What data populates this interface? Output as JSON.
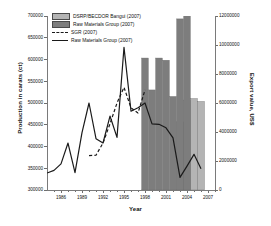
{
  "chart_data": {
    "type": "bar",
    "title": "",
    "xlabel": "Year",
    "ylabel": "Production in carats (ct)",
    "ylabel_right": "Export value, US$",
    "grid": false,
    "legend_position": "top-left",
    "xlim": [
      1984,
      2008
    ],
    "ylim": [
      300000,
      700000
    ],
    "ylim_right": [
      0,
      12000000
    ],
    "x_ticks": [
      1986,
      1989,
      1992,
      1995,
      1998,
      2001,
      2004,
      2007
    ],
    "x_tick_labels": [
      "1986",
      "1989",
      "1992",
      "1995",
      "1998",
      "2001",
      "2004",
      "2007"
    ],
    "y_ticks_left": [
      300000,
      350000,
      400000,
      450000,
      500000,
      550000,
      600000,
      650000,
      700000
    ],
    "y_tick_labels_left": [
      "300000",
      "350000",
      "400000",
      "450000",
      "500000",
      "550000",
      "600000",
      "650000",
      "700000"
    ],
    "y_ticks_right": [
      0,
      2000000,
      4000000,
      6000000,
      8000000,
      10000000,
      12000000
    ],
    "y_tick_labels_right": [
      "0",
      "2000000",
      "4000000",
      "6000000",
      "8000000",
      "10000000",
      "12000000"
    ],
    "series": [
      {
        "name": "DSRP/BECDOR Bangui (2007)",
        "type": "bar",
        "axis": "right",
        "color": "#b4b4b4",
        "x": [
          2003,
          2004,
          2005,
          2006
        ],
        "values": [
          4700000,
          6200000,
          6300000,
          6100000
        ]
      },
      {
        "name": "Raw Materials Group (2007)",
        "type": "bar",
        "axis": "right",
        "color": "#7d7d7d",
        "x": [
          1998,
          1999,
          2000,
          2001,
          2002,
          2003,
          2004
        ],
        "values": [
          9100000,
          6900000,
          9100000,
          8950000,
          6450000,
          11800000,
          12650000
        ]
      },
      {
        "name": "SGR (2007)",
        "type": "line",
        "style": "dashed",
        "axis": "left",
        "color": "#1a1a1a",
        "x": [
          1990,
          1991,
          1992,
          1993,
          1994,
          1995,
          1996,
          1997,
          1998
        ],
        "values": [
          379000,
          380000,
          408000,
          452000,
          500000,
          536000,
          489000,
          477000,
          530000
        ]
      },
      {
        "name": "Raw Materials Group (2007)",
        "type": "line",
        "style": "solid",
        "axis": "left",
        "color": "#1a1a1a",
        "x": [
          1984,
          1985,
          1986,
          1987,
          1988,
          1989,
          1990,
          1991,
          1992,
          1993,
          1994,
          1995,
          1996,
          1997,
          1998,
          1999,
          2000,
          2001,
          2002,
          2003,
          2004,
          2005,
          2006
        ],
        "values": [
          339000,
          345000,
          360000,
          408000,
          340000,
          432000,
          500000,
          418000,
          408000,
          470000,
          421000,
          628000,
          481000,
          489000,
          500000,
          452000,
          451000,
          443000,
          420000,
          329000,
          355000,
          382000,
          349000
        ]
      }
    ],
    "legend": [
      {
        "label": "DSRP/BECDOR Bangui (2007)",
        "marker": "swatch",
        "color": "#b4b4b4"
      },
      {
        "label": "Raw Materials Group (2007)",
        "marker": "swatch",
        "color": "#7d7d7d"
      },
      {
        "label": "SGR (2007)",
        "marker": "dashed",
        "color": "#1a1a1a"
      },
      {
        "label": "Raw Materials Group (2007)",
        "marker": "solid",
        "color": "#1a1a1a"
      }
    ]
  }
}
